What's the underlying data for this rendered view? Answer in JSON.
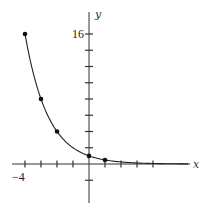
{
  "chart_data": {
    "type": "line",
    "title": "",
    "xlabel": "x",
    "ylabel": "y",
    "function": "y = (1/2)^x",
    "x": [
      -4,
      -3,
      -2,
      0,
      1
    ],
    "values": [
      16,
      8,
      4,
      1,
      0.5
    ],
    "marked_points": [
      {
        "x": -4,
        "y": 16
      },
      {
        "x": -3,
        "y": 8
      },
      {
        "x": -2,
        "y": 4
      },
      {
        "x": 0,
        "y": 1
      },
      {
        "x": 1,
        "y": 0.5
      }
    ],
    "x_ticks": [
      -4,
      -3,
      -2,
      -1,
      0,
      1,
      2,
      3,
      4
    ],
    "y_ticks": [
      -2,
      2,
      4,
      6,
      8,
      10,
      12,
      14,
      16
    ],
    "tick_labels": {
      "x": "−4",
      "y": "16"
    },
    "xlim": [
      -4.5,
      6
    ],
    "ylim": [
      -4.5,
      18.5
    ],
    "grid": false,
    "legend": "none"
  },
  "labels": {
    "x_axis": "x",
    "y_axis": "y",
    "x_tick": "−4",
    "y_tick": "16"
  }
}
